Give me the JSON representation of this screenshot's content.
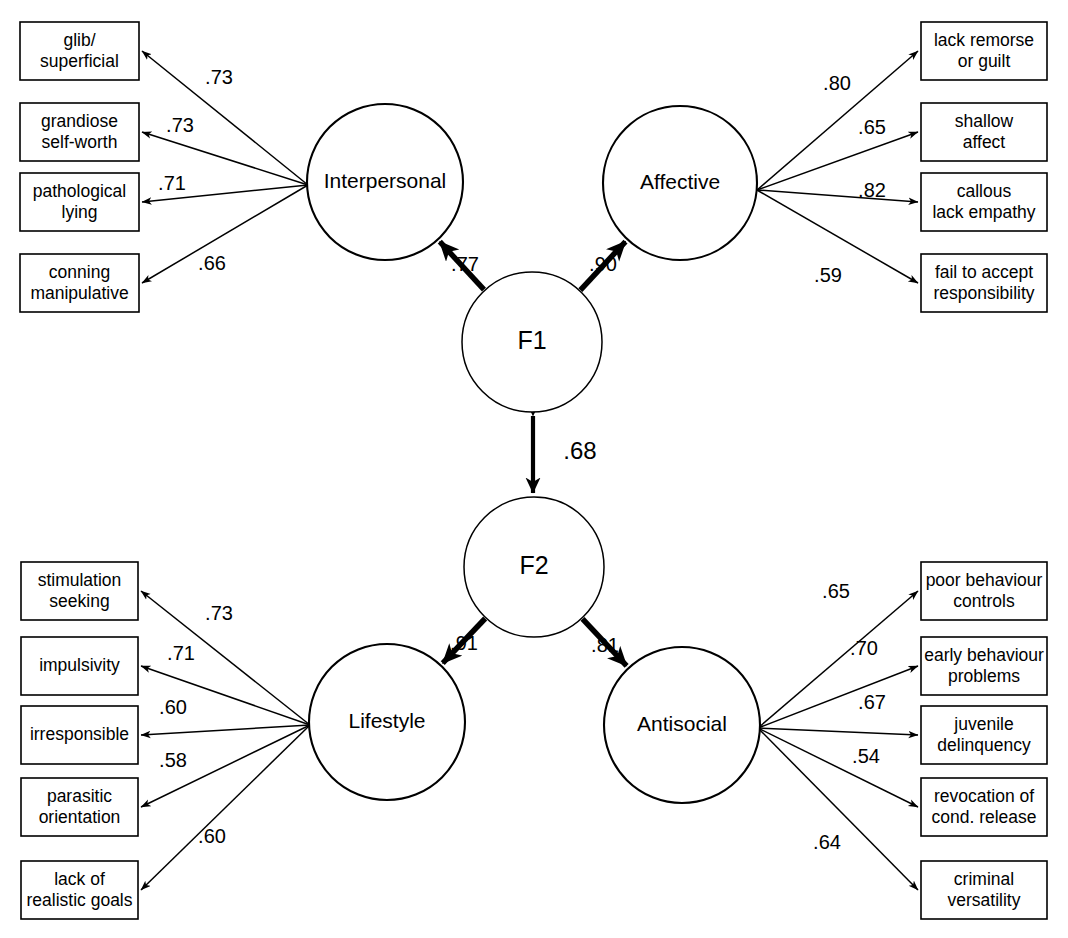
{
  "diagram": {
    "type": "structural-equation-model",
    "factors": [
      {
        "id": "f1",
        "label": "F1",
        "cx": 532,
        "cy": 342,
        "r": 70
      },
      {
        "id": "f2",
        "label": "F2",
        "cx": 534,
        "cy": 567,
        "r": 70
      }
    ],
    "factor_correlation": {
      "from": "f1",
      "to": "f2",
      "value": ".68",
      "label_x": 580,
      "label_y": 453,
      "bidirectional": true
    },
    "latents": [
      {
        "id": "interpersonal",
        "label": "Interpersonal",
        "cx": 385,
        "cy": 182,
        "r": 78,
        "side": "left"
      },
      {
        "id": "affective",
        "label": "Affective",
        "cx": 680,
        "cy": 183,
        "r": 77,
        "side": "right"
      },
      {
        "id": "lifestyle",
        "label": "Lifestyle",
        "cx": 387,
        "cy": 722,
        "r": 78,
        "side": "left"
      },
      {
        "id": "antisocial",
        "label": "Antisocial",
        "cx": 682,
        "cy": 725,
        "r": 78,
        "side": "right"
      }
    ],
    "structural_paths": [
      {
        "from": "f1",
        "to": "interpersonal",
        "value": ".77",
        "label_x": 465,
        "label_y": 266
      },
      {
        "from": "f1",
        "to": "affective",
        "value": ".90",
        "label_x": 603,
        "label_y": 266
      },
      {
        "from": "f2",
        "to": "lifestyle",
        "value": ".91",
        "label_x": 464,
        "label_y": 645
      },
      {
        "from": "f2",
        "to": "antisocial",
        "value": ".81",
        "label_x": 605,
        "label_y": 647
      }
    ],
    "indicator_groups": [
      {
        "latent": "interpersonal",
        "origin_x": 308,
        "origin_y": 185,
        "side": "left",
        "indicators": [
          {
            "lines": [
              "glib/",
              "superficial"
            ],
            "loading": ".73",
            "box_x": 20,
            "box_y": 22,
            "box_w": 119,
            "box_h": 58,
            "label_x": 219,
            "label_y": 79
          },
          {
            "lines": [
              "grandiose",
              "self-worth"
            ],
            "loading": ".73",
            "box_x": 20,
            "box_y": 103,
            "box_w": 119,
            "box_h": 58,
            "label_x": 180,
            "label_y": 127
          },
          {
            "lines": [
              "pathological",
              "lying"
            ],
            "loading": ".71",
            "box_x": 20,
            "box_y": 173,
            "box_w": 119,
            "box_h": 58,
            "label_x": 172,
            "label_y": 185
          },
          {
            "lines": [
              "conning",
              "manipulative"
            ],
            "loading": ".66",
            "box_x": 20,
            "box_y": 254,
            "box_w": 119,
            "box_h": 58,
            "label_x": 212,
            "label_y": 265
          }
        ]
      },
      {
        "latent": "affective",
        "origin_x": 757,
        "origin_y": 190,
        "side": "right",
        "indicators": [
          {
            "lines": [
              "lack remorse",
              "or guilt"
            ],
            "loading": ".80",
            "box_x": 921,
            "box_y": 22,
            "box_w": 126,
            "box_h": 58,
            "label_x": 837,
            "label_y": 85
          },
          {
            "lines": [
              "shallow",
              "affect"
            ],
            "loading": ".65",
            "box_x": 921,
            "box_y": 103,
            "box_w": 126,
            "box_h": 58,
            "label_x": 872,
            "label_y": 129
          },
          {
            "lines": [
              "callous",
              "lack empathy"
            ],
            "loading": ".82",
            "box_x": 921,
            "box_y": 173,
            "box_w": 126,
            "box_h": 58,
            "label_x": 872,
            "label_y": 192
          },
          {
            "lines": [
              "fail to accept",
              "responsibility"
            ],
            "loading": ".59",
            "box_x": 921,
            "box_y": 254,
            "box_w": 126,
            "box_h": 58,
            "label_x": 828,
            "label_y": 277
          }
        ]
      },
      {
        "latent": "lifestyle",
        "origin_x": 310,
        "origin_y": 725,
        "side": "left",
        "indicators": [
          {
            "lines": [
              "stimulation",
              "seeking"
            ],
            "loading": ".73",
            "box_x": 21,
            "box_y": 562,
            "box_w": 117,
            "box_h": 58,
            "label_x": 219,
            "label_y": 615
          },
          {
            "lines": [
              "impulsivity"
            ],
            "loading": ".71",
            "box_x": 21,
            "box_y": 637,
            "box_w": 117,
            "box_h": 58,
            "label_x": 181,
            "label_y": 655
          },
          {
            "lines": [
              "irresponsible"
            ],
            "loading": ".60",
            "box_x": 21,
            "box_y": 706,
            "box_w": 117,
            "box_h": 58,
            "label_x": 173,
            "label_y": 709
          },
          {
            "lines": [
              "parasitic",
              "orientation"
            ],
            "loading": ".58",
            "box_x": 21,
            "box_y": 778,
            "box_w": 117,
            "box_h": 58,
            "label_x": 173,
            "label_y": 762
          },
          {
            "lines": [
              "lack of",
              "realistic goals"
            ],
            "loading": ".60",
            "box_x": 21,
            "box_y": 861,
            "box_w": 117,
            "box_h": 58,
            "label_x": 212,
            "label_y": 838
          }
        ]
      },
      {
        "latent": "antisocial",
        "origin_x": 758,
        "origin_y": 728,
        "side": "right",
        "indicators": [
          {
            "lines": [
              "poor behaviour",
              "controls"
            ],
            "loading": ".65",
            "box_x": 921,
            "box_y": 562,
            "box_w": 126,
            "box_h": 58,
            "label_x": 836,
            "label_y": 593
          },
          {
            "lines": [
              "early behaviour",
              "problems"
            ],
            "loading": ".70",
            "box_x": 921,
            "box_y": 637,
            "box_w": 126,
            "box_h": 58,
            "label_x": 864,
            "label_y": 650
          },
          {
            "lines": [
              "juvenile",
              "delinquency"
            ],
            "loading": ".67",
            "box_x": 921,
            "box_y": 706,
            "box_w": 126,
            "box_h": 58,
            "label_x": 872,
            "label_y": 704
          },
          {
            "lines": [
              "revocation of",
              "cond. release"
            ],
            "loading": ".54",
            "box_x": 921,
            "box_y": 778,
            "box_w": 126,
            "box_h": 58,
            "label_x": 866,
            "label_y": 758
          },
          {
            "lines": [
              "criminal",
              "versatility"
            ],
            "loading": ".64",
            "box_x": 921,
            "box_y": 861,
            "box_w": 126,
            "box_h": 58,
            "label_x": 827,
            "label_y": 844
          }
        ]
      }
    ]
  }
}
